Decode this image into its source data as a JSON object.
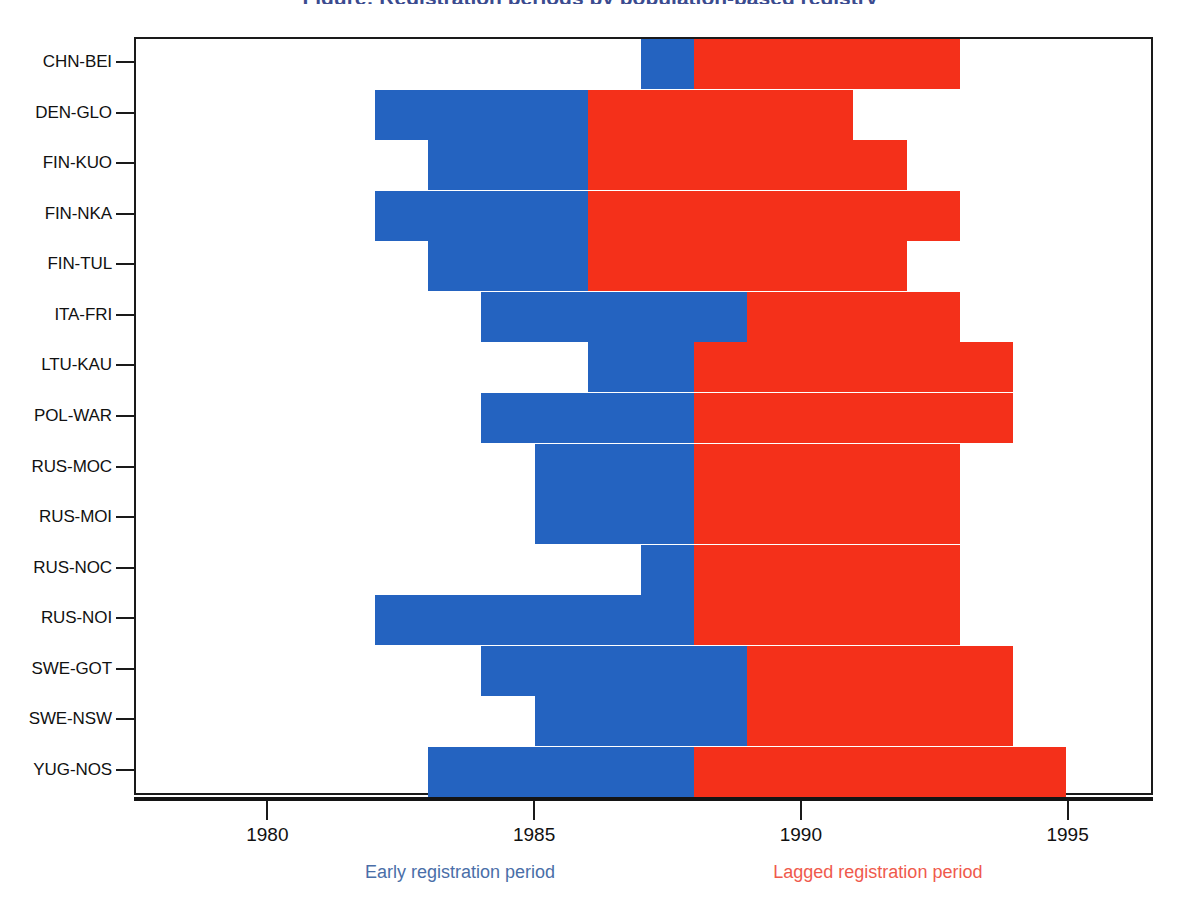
{
  "title": "Figure: Registration periods by population-based registry",
  "legend": {
    "early": {
      "label": "Early registration period",
      "color": "#4a6ea8",
      "bar_color": "#2463c0"
    },
    "lagged": {
      "label": "Lagged registration period",
      "color": "#ef5a4c",
      "bar_color": "#f4301a"
    }
  },
  "axis": {
    "x_ticks": [
      1980,
      1985,
      1990,
      1995
    ],
    "x_tick_labels": [
      "1980",
      "1985",
      "1990",
      "1995"
    ],
    "x_min": 1977.5,
    "x_max": 1996.6
  },
  "chart_data": {
    "type": "bar",
    "orientation": "horizontal",
    "subtype": "stacked-range",
    "title": "Figure: Registration periods by population-based registry",
    "xlabel": "",
    "ylabel": "",
    "xlim": [
      1977.5,
      1996.6
    ],
    "grid": false,
    "legend_position": "bottom",
    "categories": [
      "CHN-BEI",
      "DEN-GLO",
      "FIN-KUO",
      "FIN-NKA",
      "FIN-TUL",
      "ITA-FRI",
      "LTU-KAU",
      "POL-WAR",
      "RUS-MOC",
      "RUS-MOI",
      "RUS-NOC",
      "RUS-NOI",
      "SWE-GOT",
      "SWE-NSW",
      "YUG-NOS"
    ],
    "series": [
      {
        "name": "Early registration period",
        "color": "#2463c0",
        "ranges": [
          [
            1987,
            1988
          ],
          [
            1982,
            1986
          ],
          [
            1983,
            1986
          ],
          [
            1982,
            1986
          ],
          [
            1983,
            1986
          ],
          [
            1984,
            1989
          ],
          [
            1986,
            1988
          ],
          [
            1984,
            1988
          ],
          [
            1985,
            1988
          ],
          [
            1985,
            1988
          ],
          [
            1987,
            1988
          ],
          [
            1982,
            1988
          ],
          [
            1984,
            1989
          ],
          [
            1985,
            1989
          ],
          [
            1983,
            1988
          ]
        ]
      },
      {
        "name": "Lagged registration period",
        "color": "#f4301a",
        "ranges": [
          [
            1988,
            1993
          ],
          [
            1986,
            1991
          ],
          [
            1986,
            1992
          ],
          [
            1986,
            1993
          ],
          [
            1986,
            1992
          ],
          [
            1989,
            1993
          ],
          [
            1988,
            1994
          ],
          [
            1988,
            1994
          ],
          [
            1988,
            1993
          ],
          [
            1988,
            1993
          ],
          [
            1988,
            1993
          ],
          [
            1988,
            1993
          ],
          [
            1989,
            1994
          ],
          [
            1989,
            1994
          ],
          [
            1988,
            1995
          ]
        ]
      }
    ],
    "rows": [
      {
        "label": "CHN-BEI",
        "early_start": 1987,
        "early_end": 1988,
        "lagged_start": 1988,
        "lagged_end": 1993
      },
      {
        "label": "DEN-GLO",
        "early_start": 1982,
        "early_end": 1986,
        "lagged_start": 1986,
        "lagged_end": 1991
      },
      {
        "label": "FIN-KUO",
        "early_start": 1983,
        "early_end": 1986,
        "lagged_start": 1986,
        "lagged_end": 1992
      },
      {
        "label": "FIN-NKA",
        "early_start": 1982,
        "early_end": 1986,
        "lagged_start": 1986,
        "lagged_end": 1993
      },
      {
        "label": "FIN-TUL",
        "early_start": 1983,
        "early_end": 1986,
        "lagged_start": 1986,
        "lagged_end": 1992
      },
      {
        "label": "ITA-FRI",
        "early_start": 1984,
        "early_end": 1989,
        "lagged_start": 1989,
        "lagged_end": 1993
      },
      {
        "label": "LTU-KAU",
        "early_start": 1986,
        "early_end": 1988,
        "lagged_start": 1988,
        "lagged_end": 1994
      },
      {
        "label": "POL-WAR",
        "early_start": 1984,
        "early_end": 1988,
        "lagged_start": 1988,
        "lagged_end": 1994
      },
      {
        "label": "RUS-MOC",
        "early_start": 1985,
        "early_end": 1988,
        "lagged_start": 1988,
        "lagged_end": 1993
      },
      {
        "label": "RUS-MOI",
        "early_start": 1985,
        "early_end": 1988,
        "lagged_start": 1988,
        "lagged_end": 1993
      },
      {
        "label": "RUS-NOC",
        "early_start": 1987,
        "early_end": 1988,
        "lagged_start": 1988,
        "lagged_end": 1993
      },
      {
        "label": "RUS-NOI",
        "early_start": 1982,
        "early_end": 1988,
        "lagged_start": 1988,
        "lagged_end": 1993
      },
      {
        "label": "SWE-GOT",
        "early_start": 1984,
        "early_end": 1989,
        "lagged_start": 1989,
        "lagged_end": 1994
      },
      {
        "label": "SWE-NSW",
        "early_start": 1985,
        "early_end": 1989,
        "lagged_start": 1989,
        "lagged_end": 1994
      },
      {
        "label": "YUG-NOS",
        "early_start": 1983,
        "early_end": 1988,
        "lagged_start": 1988,
        "lagged_end": 1995
      }
    ]
  }
}
